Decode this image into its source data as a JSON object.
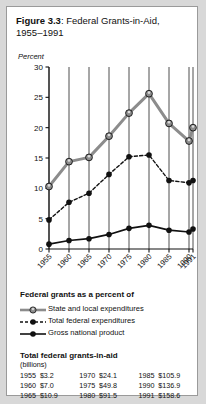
{
  "figure": {
    "number_label": "Figure 3.3",
    "title_separator": ": ",
    "title_text": "Federal Grants-in-Aid,",
    "title_line2": "1955–1991"
  },
  "chart_data": {
    "type": "line",
    "title": "Figure 3.3: Federal Grants-in-Aid, 1955–1991",
    "xlabel": "",
    "ylabel": "Percent",
    "ylim": [
      0,
      30
    ],
    "yticks": [
      0,
      5,
      10,
      15,
      20,
      25,
      30
    ],
    "ytick_labels": [
      "0",
      "5",
      "10",
      "15",
      "20",
      "25",
      "30"
    ],
    "grid": true,
    "grid_orientation": "vertical",
    "legend_position": "below-plot",
    "legend_title": "Federal grants as a percent of",
    "categories": [
      "1955",
      "1960",
      "1965",
      "1970",
      "1975",
      "1980",
      "1985",
      "1990",
      "1991"
    ],
    "x": [
      1955,
      1960,
      1965,
      1970,
      1975,
      1980,
      1985,
      1990,
      1991
    ],
    "series": [
      {
        "name": "State and local expenditures",
        "marker": "open-circle",
        "line_style": "solid-thick",
        "color": "#8c8c8c",
        "values": [
          10.3,
          14.4,
          15.1,
          18.6,
          22.4,
          25.6,
          20.7,
          17.8,
          20.0
        ]
      },
      {
        "name": "Total federal expenditures",
        "marker": "filled-circle",
        "line_style": "dashed",
        "color": "#111111",
        "values": [
          4.8,
          7.7,
          9.2,
          12.3,
          15.2,
          15.5,
          11.3,
          10.9,
          11.3
        ]
      },
      {
        "name": "Gross national product",
        "marker": "filled-circle",
        "line_style": "solid",
        "color": "#111111",
        "values": [
          0.8,
          1.4,
          1.7,
          2.4,
          3.4,
          3.9,
          3.1,
          2.8,
          3.3
        ]
      }
    ]
  },
  "legend": {
    "title": "Federal grants as a percent of",
    "items": [
      {
        "label": "State and local expenditures",
        "icon": "legend-line-state-local"
      },
      {
        "label": "Total federal expenditures",
        "icon": "legend-line-total-federal"
      },
      {
        "label": "Gross national product",
        "icon": "legend-line-gnp"
      }
    ]
  },
  "grants_table": {
    "title": "Total federal grants-in-aid",
    "units": "(billions)",
    "rows": [
      {
        "y1": "1955",
        "v1": "$3.2",
        "y2": "1970",
        "v2": "$24.1",
        "y3": "1985",
        "v3": "$105.9"
      },
      {
        "y1": "1960",
        "v1": "$7.0",
        "y2": "1975",
        "v2": "$49.8",
        "y3": "1990",
        "v3": "$136.9"
      },
      {
        "y1": "1965",
        "v1": "$10.9",
        "y2": "1980",
        "v2": "$91.5",
        "y3": "1991",
        "v3": "$158.6"
      }
    ]
  },
  "colors": {
    "state_local": "#8c8c8c",
    "total_federal": "#111111",
    "gnp": "#111111",
    "gridline": "#3a3a3a",
    "axis": "#111111"
  }
}
